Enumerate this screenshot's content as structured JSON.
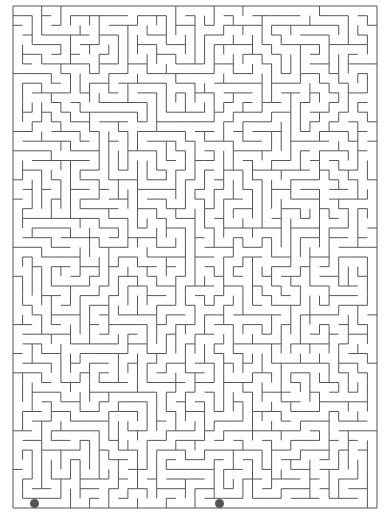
{
  "maze": {
    "left": 13,
    "top": 6,
    "right": 377,
    "bottom": 508,
    "cols": 38,
    "rows": 52,
    "wall_color": "#555555",
    "background": "#ffffff",
    "seed": 7331
  },
  "markers": [
    {
      "name": "start-marker",
      "x": 34,
      "y": 503,
      "color": "#555555"
    },
    {
      "name": "end-marker",
      "x": 219,
      "y": 503,
      "color": "#555555"
    }
  ]
}
